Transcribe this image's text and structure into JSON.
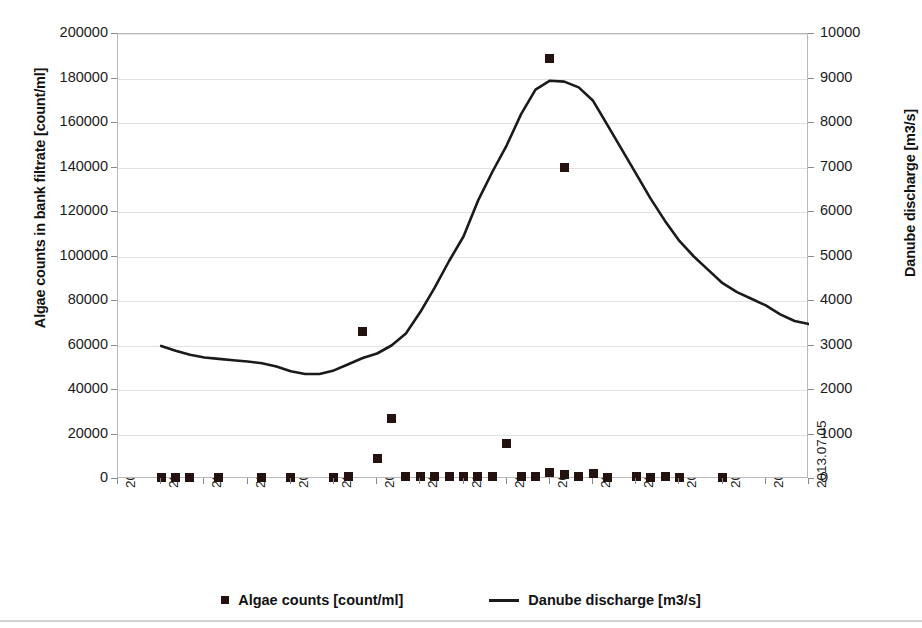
{
  "chart_data": {
    "type": "scatter",
    "title": "",
    "xlabel": "",
    "ylabel": "Algae counts in bank filtrate [count/ml]",
    "y2label": "Danube discharge [m3/s]",
    "ylim": [
      0,
      200000
    ],
    "y2lim": [
      0,
      10000
    ],
    "grid": true,
    "legend_position": "bottom",
    "y_ticks": [
      "0",
      "20000",
      "40000",
      "60000",
      "80000",
      "100000",
      "120000",
      "140000",
      "160000",
      "180000",
      "200000"
    ],
    "y_tick_values": [
      0,
      20000,
      40000,
      60000,
      80000,
      100000,
      120000,
      140000,
      160000,
      180000,
      200000
    ],
    "y2_ticks": [
      "0",
      "1000",
      "2000",
      "3000",
      "4000",
      "5000",
      "6000",
      "7000",
      "8000",
      "9000",
      "10000"
    ],
    "y2_tick_values": [
      0,
      1000,
      2000,
      3000,
      4000,
      5000,
      6000,
      7000,
      8000,
      9000,
      10000
    ],
    "x_ticks": [
      "2013.05.18",
      "2013.05.21",
      "2013.05.24",
      "2013.05.27",
      "2013.05.30",
      "2013.06.02",
      "2013.06.05",
      "2013.06.08",
      "2013.06.11",
      "2013.06.14",
      "2013.06.17",
      "2013.06.20",
      "2013.06.23",
      "2013.06.26",
      "2013.06.29",
      "2013.07.02",
      "2013.07.05"
    ],
    "x_tick_day_index": [
      0,
      3,
      6,
      9,
      12,
      15,
      18,
      21,
      24,
      27,
      30,
      33,
      36,
      39,
      42,
      45,
      48
    ],
    "x_range_days": [
      0,
      48
    ],
    "series": [
      {
        "name": "Algae counts [count/ml]",
        "type": "scatter",
        "marker": "square",
        "axis": "left",
        "color": "#241210",
        "x_days": [
          3,
          4,
          5,
          7,
          10,
          12,
          15,
          16,
          17,
          18,
          19,
          20,
          20,
          21,
          22,
          23,
          24,
          25,
          26,
          27,
          28,
          29,
          30,
          31,
          32,
          33,
          34,
          36,
          37,
          38,
          39,
          42
        ],
        "values": [
          600,
          700,
          600,
          700,
          600,
          700,
          800,
          1200,
          66500,
          9000,
          27000,
          1300,
          900,
          1200,
          1000,
          900,
          1000,
          900,
          900,
          16000,
          1100,
          1200,
          3000,
          1900,
          900,
          2600,
          700,
          900,
          800,
          900,
          800,
          800
        ],
        "highlight_points": [
          {
            "date": "2013.06.05",
            "value": 66500
          },
          {
            "date": "2013.06.04",
            "value": 27000
          },
          {
            "date": "2013.06.14",
            "value": 16000
          },
          {
            "date": "2013.06.17",
            "value": 189000
          },
          {
            "date": "2013.06.18",
            "value": 140000
          }
        ],
        "extra_x_days": [
          30,
          31
        ],
        "extra_values": [
          189000,
          140000
        ]
      },
      {
        "name": "Danube discharge [m3/s]",
        "type": "line",
        "axis": "right",
        "color": "#1a1a1a",
        "x_days": [
          3,
          4,
          5,
          6,
          7,
          8,
          9,
          10,
          11,
          12,
          13,
          14,
          15,
          16,
          17,
          18,
          19,
          20,
          21,
          22,
          23,
          24,
          25,
          26,
          27,
          28,
          29,
          30,
          31,
          32,
          33,
          34,
          35,
          36,
          37,
          38,
          39,
          40,
          41,
          42,
          43,
          44,
          45
        ],
        "values": [
          2990,
          2880,
          2790,
          2730,
          2700,
          2670,
          2640,
          2600,
          2530,
          2420,
          2360,
          2360,
          2440,
          2580,
          2720,
          2820,
          3000,
          3270,
          3750,
          4300,
          4900,
          5450,
          6250,
          6900,
          7500,
          8200,
          8750,
          8950,
          8930,
          8800,
          8500,
          7950,
          7400,
          6850,
          6300,
          5800,
          5350,
          5000,
          4700,
          4400,
          4200,
          4050,
          3900
        ],
        "values_continued_x": [
          46,
          47,
          48,
          49,
          50,
          51,
          52,
          53,
          54,
          55,
          56
        ],
        "values_continued": [
          3700,
          3550,
          3480,
          3420,
          3400,
          3600,
          4100,
          4600,
          5050,
          4450,
          3680
        ]
      }
    ]
  },
  "axes": {
    "left_title": "Algae counts in bank filtrate [count/ml]",
    "right_title": "Danube discharge [m3/s]"
  },
  "legend": {
    "entries": [
      {
        "label": "Algae counts [count/ml]",
        "marker": "square-marker"
      },
      {
        "label": "Danube discharge [m3/s]",
        "marker": "line-marker"
      }
    ]
  }
}
